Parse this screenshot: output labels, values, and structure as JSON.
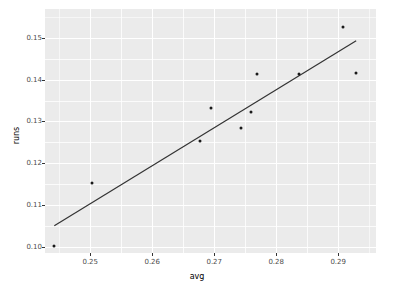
{
  "chart_data": {
    "type": "scatter",
    "title": "",
    "xlabel": "avg",
    "ylabel": "runs",
    "xlim": [
      0.2427,
      0.2961
    ],
    "ylim": [
      0.0985,
      0.1569
    ],
    "xticks": [
      0.25,
      0.26,
      0.27,
      0.28,
      0.29
    ],
    "xticklabels": [
      "0.25",
      "0.26",
      "0.27",
      "0.28",
      "0.29"
    ],
    "yticks": [
      0.1,
      0.11,
      0.12,
      0.13,
      0.14,
      0.15
    ],
    "yticklabels": [
      "0.10",
      "0.11",
      "0.12",
      "0.13",
      "0.14",
      "0.15"
    ],
    "grid": true,
    "legend": "none",
    "panel_background": "#ebebeb",
    "gridline_color": "#ffffff",
    "point_color": "#1a1a1a",
    "line_color": "#333333",
    "x": [
      0.2442,
      0.2503,
      0.2677,
      0.2694,
      0.2744,
      0.276,
      0.2769,
      0.2837,
      0.2908,
      0.2929
    ],
    "y": [
      0.1001,
      0.1152,
      0.1252,
      0.1331,
      0.1285,
      0.1323,
      0.1414,
      0.1414,
      0.1526,
      0.1416
    ],
    "points": [
      {
        "x": 0.2442,
        "y": 0.1001
      },
      {
        "x": 0.2503,
        "y": 0.1152
      },
      {
        "x": 0.2677,
        "y": 0.1252
      },
      {
        "x": 0.2694,
        "y": 0.1331
      },
      {
        "x": 0.2744,
        "y": 0.1285
      },
      {
        "x": 0.276,
        "y": 0.1323
      },
      {
        "x": 0.2769,
        "y": 0.1414
      },
      {
        "x": 0.2837,
        "y": 0.1414
      },
      {
        "x": 0.2908,
        "y": 0.1526
      },
      {
        "x": 0.2929,
        "y": 0.1416
      }
    ],
    "trendline": {
      "type": "linear-fit",
      "x0": 0.2442,
      "y0": 0.105,
      "x1": 0.2929,
      "y1": 0.1493
    }
  }
}
